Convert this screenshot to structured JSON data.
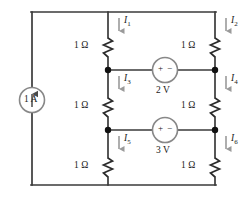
{
  "diagram": {
    "colors": {
      "wire": "#3a3a3a",
      "node": "#111111",
      "arrow": "#9a9a9a",
      "text": "#1a1a1a",
      "background": "#ffffff"
    },
    "current_source": {
      "label": "1 A",
      "symbol": "circle-with-up-arrow",
      "direction": "up"
    },
    "voltage_sources": [
      {
        "label": "2 V",
        "plus": "+",
        "minus": "−",
        "polarity": "plus-left-minus-right"
      },
      {
        "label": "3 V",
        "plus": "+",
        "minus": "−",
        "polarity": "plus-left-minus-right"
      }
    ],
    "resistors": [
      {
        "label": "1 Ω",
        "branch": "middle-top"
      },
      {
        "label": "1 Ω",
        "branch": "right-top"
      },
      {
        "label": "1 Ω",
        "branch": "middle-center"
      },
      {
        "label": "1 Ω",
        "branch": "right-center"
      },
      {
        "label": "1 Ω",
        "branch": "middle-bottom"
      },
      {
        "label": "1 Ω",
        "branch": "right-bottom"
      }
    ],
    "currents": [
      {
        "name": "I",
        "sub": "1",
        "direction": "down",
        "branch": "middle-top"
      },
      {
        "name": "I",
        "sub": "2",
        "direction": "down",
        "branch": "right-top"
      },
      {
        "name": "I",
        "sub": "3",
        "direction": "down",
        "branch": "middle-center"
      },
      {
        "name": "I",
        "sub": "4",
        "direction": "down",
        "branch": "right-center"
      },
      {
        "name": "I",
        "sub": "5",
        "direction": "down",
        "branch": "middle-bottom"
      },
      {
        "name": "I",
        "sub": "6",
        "direction": "down",
        "branch": "right-bottom"
      }
    ]
  }
}
